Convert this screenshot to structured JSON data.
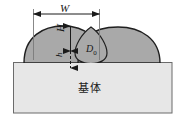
{
  "figure": {
    "labels": {
      "width": "W",
      "height": "H",
      "small_height": "h",
      "droplet_diameter_symbol": "D",
      "droplet_diameter_subscript": "0",
      "substrate": "基体"
    },
    "colors": {
      "droplet_fill": "#a9a9a9",
      "droplet_stroke": "#1f1f1f",
      "substrate_fill": "#e7e7e7",
      "substrate_stroke": "#6b6b6b",
      "dimension_line": "#1a1a1a",
      "background": "#ffffff"
    },
    "geometry": {
      "substrate_rect": {
        "x": 13,
        "y": 62,
        "width": 159,
        "height": 51
      },
      "left_droplet": {
        "cx": 63,
        "cy": 52,
        "rx": 40,
        "ry": 25
      },
      "right_droplet": {
        "cx": 118,
        "cy": 52,
        "rx": 42,
        "ry": 25
      },
      "center_droplet": {
        "cx": 91,
        "cy": 48,
        "rx": 16,
        "ry": 21
      },
      "width_dimension": {
        "x1": 33,
        "x2": 99,
        "y": 14
      },
      "height_dimension": {
        "x": 70,
        "y1": 26,
        "y2": 68,
        "mid_y": 51
      }
    }
  }
}
